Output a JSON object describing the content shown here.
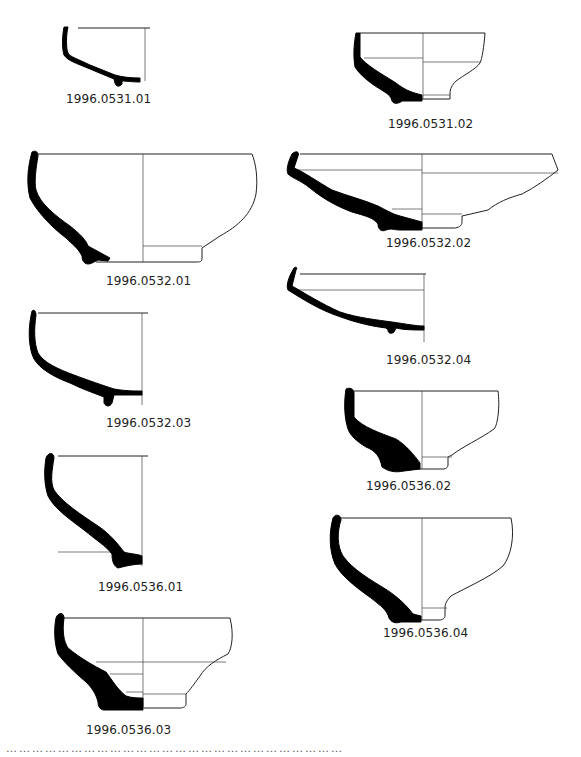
{
  "figure": {
    "type": "pottery-profile-drawings",
    "sherds": [
      {
        "id": "1996.0531.01"
      },
      {
        "id": "1996.0531.02"
      },
      {
        "id": "1996.0532.01"
      },
      {
        "id": "1996.0532.02"
      },
      {
        "id": "1996.0532.04"
      },
      {
        "id": "1996.0532.03"
      },
      {
        "id": "1996.0536.02"
      },
      {
        "id": "1996.0536.01"
      },
      {
        "id": "1996.0536.04"
      },
      {
        "id": "1996.0536.03"
      }
    ],
    "footer_fragment": "……………………………………………………………………"
  }
}
